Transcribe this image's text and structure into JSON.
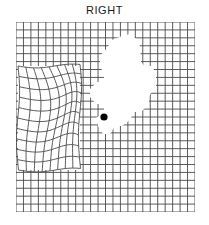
{
  "chart_title": "RIGHT",
  "colors": {
    "background": "#ffffff",
    "grid_line": "#4a4a4a",
    "grid_line_light": "#9a9a9a",
    "fixation_dot": "#000000",
    "scotoma_fill": "#ffffff",
    "title_text": "#1a1a1a"
  },
  "chart_data": {
    "type": "table",
    "title": "RIGHT",
    "subtitle": "",
    "xlabel": "",
    "ylabel": "",
    "grid": {
      "columns": 24,
      "rows": 24,
      "cell_size_px": 7.46,
      "origin_x_px": 16,
      "origin_y_px": 22,
      "width_px": 179,
      "height_px": 190,
      "line_color": "#4a4a4a",
      "line_width_px": 0.9,
      "grid_on": true
    },
    "fixation_dot": {
      "label": "central fixation dot",
      "cx_px": 88,
      "cy_px": 95,
      "r_px": 3.6,
      "color": "#000000"
    },
    "scotoma": {
      "label": "scotoma (missing area)",
      "fill": "#ffffff",
      "center_px": [
        128,
        88
      ],
      "bbox_px": [
        104,
        36,
        52,
        112
      ],
      "polygon_px": [
        [
          122,
          36
        ],
        [
          130,
          34
        ],
        [
          138,
          40
        ],
        [
          141,
          50
        ],
        [
          140,
          60
        ],
        [
          144,
          66
        ],
        [
          152,
          66
        ],
        [
          156,
          74
        ],
        [
          156,
          86
        ],
        [
          149,
          96
        ],
        [
          149,
          104
        ],
        [
          141,
          112
        ],
        [
          134,
          112
        ],
        [
          130,
          120
        ],
        [
          122,
          126
        ],
        [
          115,
          126
        ],
        [
          110,
          134
        ],
        [
          103,
          134
        ],
        [
          98,
          126
        ],
        [
          96,
          118
        ],
        [
          104,
          112
        ],
        [
          104,
          104
        ],
        [
          96,
          104
        ],
        [
          90,
          97
        ],
        [
          90,
          89
        ],
        [
          97,
          82
        ],
        [
          104,
          82
        ],
        [
          104,
          74
        ],
        [
          100,
          66
        ],
        [
          100,
          56
        ],
        [
          107,
          48
        ],
        [
          112,
          40
        ]
      ]
    },
    "distortion": {
      "label": "wavy distorted grid region (metamorphopsia)",
      "bbox_px": [
        18,
        66,
        62,
        104
      ],
      "columns": 8,
      "rows": 10,
      "line_color": "#4a4a4a"
    },
    "legend": [],
    "annotations": []
  }
}
